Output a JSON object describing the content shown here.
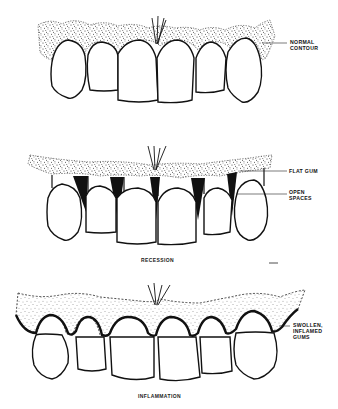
{
  "figure": {
    "panels": [
      {
        "id": "normal",
        "caption": "",
        "callouts": [
          {
            "line1": "NORMAL",
            "line2": "CONTOUR"
          }
        ]
      },
      {
        "id": "recession",
        "caption": "RECESSION",
        "callouts": [
          {
            "line1": "FLAT GUM",
            "line2": ""
          },
          {
            "line1": "OPEN",
            "line2": "SPACES"
          }
        ]
      },
      {
        "id": "inflammation",
        "caption": "INFLAMMATION",
        "callouts": [
          {
            "line1": "SWOLLEN,",
            "line2": "INFLAMED",
            "line3": "GUMS"
          }
        ]
      }
    ]
  },
  "colors": {
    "ink": "#111111",
    "background": "#ffffff",
    "stipple": "#333333"
  }
}
